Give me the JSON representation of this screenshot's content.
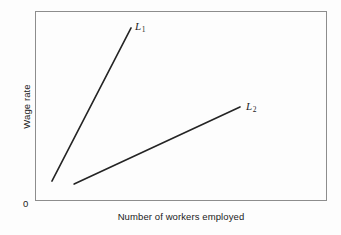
{
  "chart_data": {
    "type": "line",
    "title": "",
    "subtitle": "",
    "xlabel": "Number of workers employed",
    "ylabel": "Wage rate",
    "origin_label": "0",
    "grid": false,
    "legend_position": "inline-end-of-line",
    "axis_ticks": {
      "x": [],
      "y": []
    },
    "xlim": [
      0,
      100
    ],
    "ylim": [
      0,
      100
    ],
    "note": "Two upward-sloping labour supply curves drawn on unscaled axes; L1 is steep (inelastic supply), L2 is shallow (elastic supply).",
    "series": [
      {
        "name": "L1",
        "label_text": "L",
        "label_subscript": "1",
        "description": "steep labour supply curve",
        "color": "#242424",
        "points": [
          {
            "x": 5.8,
            "y": 10.5
          },
          {
            "x": 32.9,
            "y": 91.1
          }
        ]
      },
      {
        "name": "L2",
        "label_text": "L",
        "label_subscript": "2",
        "description": "shallow labour supply curve",
        "color": "#242424",
        "points": [
          {
            "x": 13.4,
            "y": 8.9
          },
          {
            "x": 70.2,
            "y": 49.5
          }
        ]
      }
    ]
  },
  "colors": {
    "background": "#fdfdfd",
    "frame": "#8d8d8d",
    "line": "#242424",
    "text": "#1b1b1b"
  }
}
